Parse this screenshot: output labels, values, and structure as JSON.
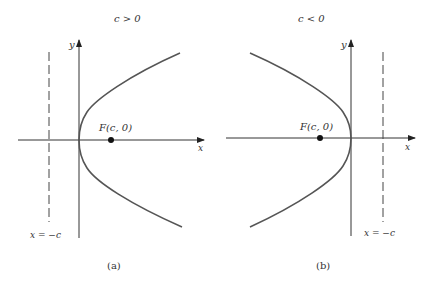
{
  "panels": [
    {
      "id": "a",
      "condition": "c > 0",
      "y_axis_label": "y",
      "x_axis_label": "x",
      "focus_label": "F(c, 0)",
      "directrix_label": "x = −c",
      "caption": "(a)",
      "opening": "right"
    },
    {
      "id": "b",
      "condition": "c < 0",
      "y_axis_label": "y",
      "x_axis_label": "x",
      "focus_label": "F(c, 0)",
      "directrix_label": "x = −c",
      "caption": "(b)",
      "opening": "left"
    }
  ],
  "colors": {
    "curve": "#555555",
    "axes": "#333333",
    "directrix": "#444444",
    "text": "#333333"
  }
}
